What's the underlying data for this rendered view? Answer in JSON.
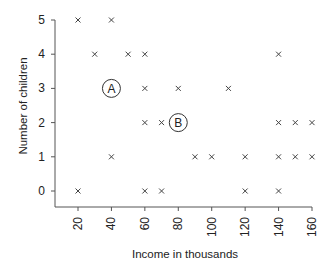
{
  "chart_data": {
    "type": "scatter",
    "title": "",
    "xlabel": "Income in thousands",
    "ylabel": "Number of children",
    "xlim": [
      15,
      162
    ],
    "ylim": [
      -0.45,
      5.2
    ],
    "x_ticks": [
      20,
      40,
      60,
      80,
      100,
      120,
      140,
      160
    ],
    "y_ticks": [
      0,
      1,
      2,
      3,
      4,
      5
    ],
    "grid": false,
    "marker": "x",
    "points": [
      {
        "x": 20,
        "y": 5
      },
      {
        "x": 40,
        "y": 5
      },
      {
        "x": 30,
        "y": 4
      },
      {
        "x": 50,
        "y": 4
      },
      {
        "x": 60,
        "y": 4
      },
      {
        "x": 140,
        "y": 4
      },
      {
        "x": 60,
        "y": 3
      },
      {
        "x": 80,
        "y": 3
      },
      {
        "x": 110,
        "y": 3
      },
      {
        "x": 60,
        "y": 2
      },
      {
        "x": 70,
        "y": 2
      },
      {
        "x": 140,
        "y": 2
      },
      {
        "x": 150,
        "y": 2
      },
      {
        "x": 160,
        "y": 2
      },
      {
        "x": 40,
        "y": 1
      },
      {
        "x": 90,
        "y": 1
      },
      {
        "x": 100,
        "y": 1
      },
      {
        "x": 120,
        "y": 1
      },
      {
        "x": 140,
        "y": 1
      },
      {
        "x": 150,
        "y": 1
      },
      {
        "x": 160,
        "y": 1
      },
      {
        "x": 20,
        "y": 0
      },
      {
        "x": 60,
        "y": 0
      },
      {
        "x": 70,
        "y": 0
      },
      {
        "x": 120,
        "y": 0
      },
      {
        "x": 140,
        "y": 0
      }
    ],
    "annotations": [
      {
        "label": "A",
        "x": 40,
        "y": 3
      },
      {
        "label": "B",
        "x": 80,
        "y": 2
      }
    ]
  }
}
